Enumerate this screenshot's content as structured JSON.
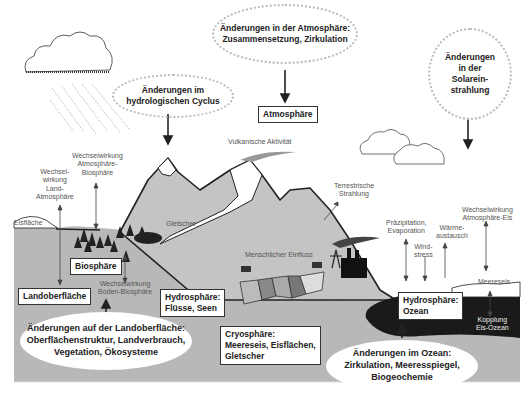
{
  "bubbles": {
    "atmosphere_change": {
      "line1": "Änderungen in der Atmosphäre:",
      "line2": "Zusammensetzung, Zirkulation"
    },
    "hydro_cycle_change": {
      "line1": "Änderungen im",
      "line2": "hydrologischen Cyclus"
    },
    "solar_change": {
      "line1": "Änderungen",
      "line2": "in der",
      "line3": "Solarein-",
      "line4": "strahlung"
    },
    "land_change": {
      "line1": "Änderungen auf der Landoberfläche:",
      "line2": "Oberflächenstruktur, Landverbrauch,",
      "line3": "Vegetation, Ökosysteme"
    },
    "ocean_change": {
      "line1": "Änderungen im Ozean:",
      "line2": "Zirkulation, Meeresspiegel,",
      "line3": "Biogeochemie"
    }
  },
  "boxes": {
    "atmosphaere": "Atmosphäre",
    "biosphaere": "Biosphäre",
    "landoberflaeche": "Landoberfläche",
    "hydro_fluesse": {
      "line1": "Hydrosphäre:",
      "line2": "Flüsse, Seen"
    },
    "cryosphaere": {
      "line1": "Cryosphäre:",
      "line2": "Meereseis, Eisflächen,",
      "line3": "Gletscher"
    },
    "hydro_ozean": {
      "line1": "Hydrosphäre:",
      "line2": "Ozean"
    }
  },
  "labels": {
    "vulkanisch": "Vulkanische Aktivität",
    "ww_atm_bio": {
      "line1": "Wechselwirkung",
      "line2": "Atmosphäre-",
      "line3": "Biosphäre"
    },
    "ww_land_atm": {
      "line1": "Wechsel-",
      "line2": "wirkung",
      "line3": "Land-",
      "line4": "Atmosphäre"
    },
    "eisflaeche": "Eisfläche",
    "gletscher": "Gletscher",
    "terrestrisch": {
      "line1": "Terrestrische",
      "line2": "Strahlung"
    },
    "menschlich": "Menschlicher Einfluss",
    "praezipitation": {
      "line1": "Präzipitation,",
      "line2": "Evaporation"
    },
    "waerme": {
      "line1": "Wärme-",
      "line2": "austausch"
    },
    "wind": {
      "line1": "Wind-",
      "line2": "stress"
    },
    "ww_atm_eis": {
      "line1": "Wechselwirkung",
      "line2": "Atmosphäre-Eis"
    },
    "meereseis": "Meereseis",
    "kopplung": {
      "line1": "Kopplung",
      "line2": "Eis-Ozean"
    },
    "ww_boden_bio": {
      "line1": "Wechselwirkung",
      "line2": "Boden-Biosphäre"
    }
  },
  "colors": {
    "land": "#b8b8b8",
    "mountain": "#c4c4c4",
    "ocean": "#1a1a1a",
    "outline": "#222222",
    "dotted_border": "#bbbbbb"
  }
}
